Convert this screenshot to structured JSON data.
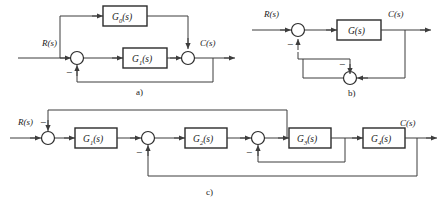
{
  "figure": {
    "type": "block-diagram",
    "panel_count": 3,
    "line_color": "#3d3d3d",
    "block_stroke": "#2b2b2b",
    "background": "#ffffff"
  },
  "panels": [
    {
      "id": "a",
      "label": "a)",
      "input_label": "R(s)",
      "output_label": "C(s)",
      "blocks": [
        {
          "name": "G",
          "subscript": "0",
          "suffix": "(s)",
          "full": "G0(s)"
        },
        {
          "name": "G",
          "subscript": "1",
          "suffix": "(s)",
          "full": "G1(s)"
        }
      ],
      "summing_junctions": [
        {
          "id": "a-sum-1",
          "signs": [
            "+",
            "-"
          ]
        },
        {
          "id": "a-sum-2",
          "signs": [
            "+",
            "+"
          ]
        }
      ],
      "minus_sign": "−",
      "description": "Feedforward G0 around forward path G1 with unity negative feedback"
    },
    {
      "id": "b",
      "label": "b)",
      "input_label": "R(s)",
      "output_label": "C(s)",
      "blocks": [
        {
          "name": "G",
          "subscript": "",
          "suffix": "(s)",
          "full": "G(s)"
        }
      ],
      "summing_junctions": [
        {
          "id": "b-sum-1",
          "signs": [
            "+",
            "-"
          ]
        },
        {
          "id": "b-sum-2",
          "signs": [
            "+",
            "-"
          ]
        }
      ],
      "minus_sign": "−",
      "description": "Forward block G with inner summing junction in feedback path"
    },
    {
      "id": "c",
      "label": "c)",
      "input_label": "R(s)",
      "output_label": "C(s)",
      "blocks": [
        {
          "name": "G",
          "subscript": "1",
          "suffix": "(s)",
          "full": "G1(s)"
        },
        {
          "name": "G",
          "subscript": "2",
          "suffix": "(s)",
          "full": "G2(s)"
        },
        {
          "name": "G",
          "subscript": "3",
          "suffix": "(s)",
          "full": "G3(s)"
        },
        {
          "name": "G",
          "subscript": "4",
          "suffix": "(s)",
          "full": "G4(s)"
        }
      ],
      "summing_junctions": [
        {
          "id": "c-sum-1",
          "signs": [
            "+",
            "-"
          ]
        },
        {
          "id": "c-sum-2",
          "signs": [
            "+",
            "-"
          ]
        },
        {
          "id": "c-sum-3",
          "signs": [
            "+",
            "-"
          ]
        }
      ],
      "minus_sign": "−",
      "description": "Four cascaded blocks with three nested negative feedback loops"
    }
  ]
}
